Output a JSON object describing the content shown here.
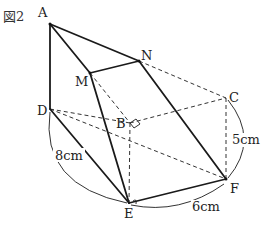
{
  "figure": {
    "caption": "図2",
    "vertices": {
      "A": {
        "label": "A",
        "x": 50,
        "y": 24
      },
      "N": {
        "label": "N",
        "x": 139,
        "y": 61
      },
      "M": {
        "label": "M",
        "x": 90,
        "y": 73
      },
      "D": {
        "label": "D",
        "x": 50,
        "y": 109
      },
      "B": {
        "label": "B",
        "x": 130,
        "y": 123
      },
      "C": {
        "label": "C",
        "x": 226,
        "y": 98
      },
      "E": {
        "label": "E",
        "x": 129,
        "y": 203
      },
      "F": {
        "label": "F",
        "x": 226,
        "y": 179
      }
    },
    "dimensions": {
      "DE": "8cm",
      "EF": "6cm",
      "CF": "5cm"
    }
  }
}
